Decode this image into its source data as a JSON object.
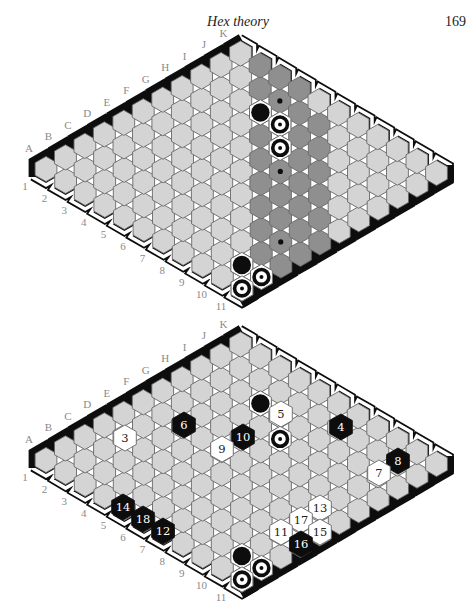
{
  "page": {
    "running_head": "Hex theory",
    "page_number": "169"
  },
  "colors": {
    "cell": "#d4d4d4",
    "cell_border": "#666666",
    "shaded_cell": "#8f8f8f",
    "black": "#0d0d0d",
    "white": "#ffffff",
    "label": "#8a8a8a"
  },
  "board_size": 11,
  "letters": [
    "A",
    "B",
    "C",
    "D",
    "E",
    "F",
    "G",
    "H",
    "I",
    "J",
    "K"
  ],
  "rows": [
    "1",
    "2",
    "3",
    "4",
    "5",
    "6",
    "7",
    "8",
    "9",
    "10",
    "11"
  ],
  "boards": [
    {
      "name": "top-board",
      "origin": [
        46,
        169
      ],
      "shaded_cells": [
        [
          10,
          1
        ],
        [
          9,
          2
        ],
        [
          10,
          2
        ],
        [
          8,
          3
        ],
        [
          9,
          3
        ],
        [
          10,
          3
        ],
        [
          7,
          4
        ],
        [
          8,
          4
        ],
        [
          9,
          4
        ],
        [
          6,
          5
        ],
        [
          7,
          5
        ],
        [
          8,
          5
        ],
        [
          9,
          5
        ],
        [
          5,
          6
        ],
        [
          6,
          6
        ],
        [
          7,
          6
        ],
        [
          8,
          6
        ],
        [
          4,
          7
        ],
        [
          5,
          7
        ],
        [
          6,
          7
        ],
        [
          7,
          7
        ],
        [
          3,
          8
        ],
        [
          4,
          8
        ],
        [
          5,
          8
        ],
        [
          6,
          8
        ],
        [
          2,
          9
        ],
        [
          3,
          9
        ],
        [
          4,
          9
        ],
        [
          5,
          9
        ],
        [
          1,
          10
        ],
        [
          2,
          10
        ],
        [
          3,
          10
        ],
        [
          4,
          10
        ]
      ],
      "dot_cells": [
        [
          9,
          3
        ],
        [
          6,
          6
        ],
        [
          3,
          9
        ]
      ],
      "stones": [
        {
          "cell": [
            8,
            3
          ],
          "type": "black"
        },
        {
          "cell": [
            8,
            4
          ],
          "type": "white-dot"
        },
        {
          "cell": [
            7,
            5
          ],
          "type": "white-dot"
        },
        {
          "cell": [
            1,
            9
          ],
          "type": "black"
        },
        {
          "cell": [
            1,
            10
          ],
          "type": "white-dot"
        },
        {
          "cell": [
            0,
            10
          ],
          "type": "white-dot"
        }
      ],
      "numbered": []
    },
    {
      "name": "bottom-board",
      "origin": [
        46,
        460
      ],
      "shaded_cells": [],
      "dot_cells": [],
      "stones": [
        {
          "cell": [
            8,
            3
          ],
          "type": "black"
        },
        {
          "cell": [
            8,
            4
          ],
          "type": "white-dot"
        },
        {
          "cell": [
            7,
            5
          ],
          "type": "white-dot"
        },
        {
          "cell": [
            1,
            9
          ],
          "type": "black"
        },
        {
          "cell": [
            1,
            10
          ],
          "type": "white-dot"
        },
        {
          "cell": [
            0,
            10
          ],
          "type": "white-dot"
        }
      ],
      "numbered": [
        {
          "n": "3",
          "color": "white",
          "xy": [
            125,
            438
          ]
        },
        {
          "n": "6",
          "color": "black",
          "xy": [
            184,
            425
          ]
        },
        {
          "n": "5",
          "color": "white",
          "xy": [
            281,
            414
          ]
        },
        {
          "n": "10",
          "color": "black",
          "xy": [
            243,
            437
          ]
        },
        {
          "n": "9",
          "color": "white",
          "xy": [
            222,
            449
          ]
        },
        {
          "n": "4",
          "color": "black",
          "xy": [
            341,
            427
          ]
        },
        {
          "n": "8",
          "color": "black",
          "xy": [
            398,
            461
          ]
        },
        {
          "n": "7",
          "color": "white",
          "xy": [
            379,
            473
          ]
        },
        {
          "n": "14",
          "color": "black",
          "xy": [
            123,
            507
          ]
        },
        {
          "n": "18",
          "color": "black",
          "xy": [
            143,
            519
          ]
        },
        {
          "n": "12",
          "color": "black",
          "xy": [
            163,
            531
          ]
        },
        {
          "n": "13",
          "color": "white",
          "xy": [
            320,
            508
          ]
        },
        {
          "n": "17",
          "color": "white",
          "xy": [
            301,
            520
          ]
        },
        {
          "n": "15",
          "color": "white",
          "xy": [
            320,
            532
          ]
        },
        {
          "n": "11",
          "color": "white",
          "xy": [
            281,
            532
          ]
        },
        {
          "n": "16",
          "color": "black",
          "xy": [
            301,
            544
          ]
        }
      ]
    }
  ]
}
